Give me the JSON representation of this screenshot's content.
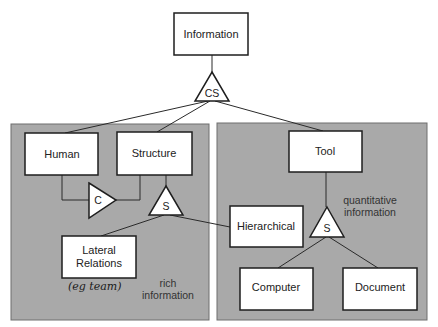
{
  "diagram": {
    "colors": {
      "panel_fill": "#a9a9a9",
      "box_fill": "#ffffff",
      "stroke": "#1e1e1e"
    },
    "nodes": {
      "information": "Information",
      "human": "Human",
      "structure": "Structure",
      "tool": "Tool",
      "lateral_line1": "Lateral",
      "lateral_line2": "Relations",
      "hierarchical": "Hierarchical",
      "computer": "Computer",
      "document": "Document"
    },
    "connectors": {
      "cs": "CS",
      "c": "C",
      "s_left": "S",
      "s_right": "S"
    },
    "annotations": {
      "rich_line1": "rich",
      "rich_line2": "information",
      "quant_line1": "quantitative",
      "quant_line2": "information",
      "handwritten": "(eg team)"
    },
    "edges": [
      [
        "Information",
        "CS"
      ],
      [
        "CS",
        "Human"
      ],
      [
        "CS",
        "Structure"
      ],
      [
        "CS",
        "Tool"
      ],
      [
        "Human",
        "C"
      ],
      [
        "Structure",
        "C"
      ],
      [
        "Structure",
        "S-left"
      ],
      [
        "S-left",
        "Lateral Relations"
      ],
      [
        "S-left",
        "Hierarchical"
      ],
      [
        "Tool",
        "S-right"
      ],
      [
        "S-right",
        "Computer"
      ],
      [
        "S-right",
        "Document"
      ]
    ]
  }
}
